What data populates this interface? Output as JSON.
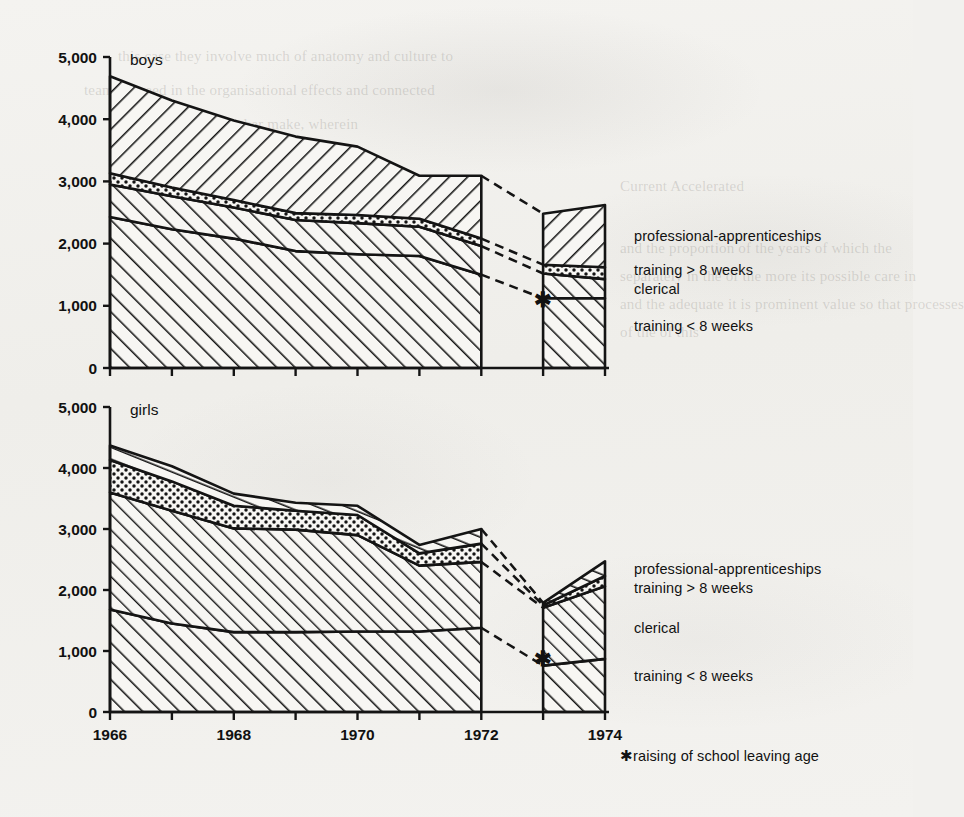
{
  "figure": {
    "panels": [
      "boys",
      "girls"
    ],
    "footnote": "✱raising of school leaving age",
    "star_symbol": "✱"
  },
  "ghost": {
    "l1": "this case they involve much of anatomy and culture to",
    "l2": "team succeed in the organisational effects and connected",
    "l3": "to investigate this other make, wherein",
    "l4": "Current Accelerated",
    "l5": "and the proportion of the years of which the",
    "l6": "separately in the of the more its possible care in",
    "l7": "and the adequate it is prominent value so that processes",
    "l8": "of the of this"
  },
  "chart_data": {
    "type": "area",
    "title": "",
    "xlabel": "",
    "ylabel": "",
    "stacked": true,
    "grid": false,
    "legend_position": "right",
    "xlim": [
      1966,
      1974
    ],
    "ylim": [
      0,
      5000
    ],
    "x": [
      1966,
      1967,
      1968,
      1969,
      1970,
      1971,
      1972,
      1973,
      1974
    ],
    "xticks": [
      1966,
      1967,
      1968,
      1969,
      1970,
      1971,
      1972,
      1973,
      1974
    ],
    "xticklabels": [
      "1966",
      "",
      "1968",
      "",
      "1970",
      "",
      "1972",
      "",
      "1974"
    ],
    "yticks": [
      0,
      1000,
      2000,
      3000,
      4000,
      5000
    ],
    "yticklabels": [
      "0",
      "1,000",
      "2,000",
      "3,000",
      "4,000",
      "5,000"
    ],
    "band_order_bottom_to_top": [
      "training < 8 weeks",
      "clerical",
      "training > 8 weeks",
      "professional-apprenticeships"
    ],
    "gap_between": [
      1972,
      1973
    ],
    "gap_note": "dashed connector across raising of school leaving age",
    "panels": [
      {
        "name": "boys",
        "label": "boys",
        "star_x": 1973,
        "star_y": 980,
        "series": [
          {
            "name": "training < 8 weeks",
            "pattern": "diagonal-hatch-right",
            "cumulative_top": [
              2430,
              2230,
              2080,
              1880,
              1830,
              1800,
              1500,
              1120,
              1120
            ]
          },
          {
            "name": "clerical",
            "pattern": "diagonal-hatch-right",
            "cumulative_top": [
              2950,
              2760,
              2580,
              2380,
              2330,
              2270,
              1960,
              1520,
              1430
            ]
          },
          {
            "name": "training > 8 weeks",
            "pattern": "dotted",
            "cumulative_top": [
              3130,
              2900,
              2700,
              2490,
              2460,
              2400,
              2080,
              1660,
              1620
            ]
          },
          {
            "name": "professional-apprenticeships",
            "pattern": "diagonal-hatch-left",
            "cumulative_top": [
              4690,
              4300,
              3980,
              3720,
              3560,
              3090,
              3090,
              2480,
              2620
            ]
          }
        ]
      },
      {
        "name": "girls",
        "label": "girls",
        "star_x": 1973,
        "star_y": 760,
        "series": [
          {
            "name": "training < 8 weeks",
            "pattern": "diagonal-hatch-right",
            "cumulative_top": [
              1680,
              1450,
              1310,
              1310,
              1320,
              1320,
              1380,
              760,
              870
            ]
          },
          {
            "name": "clerical",
            "pattern": "diagonal-hatch-right",
            "cumulative_top": [
              3600,
              3300,
              3010,
              2990,
              2900,
              2400,
              2460,
              1710,
              2060
            ]
          },
          {
            "name": "training > 8 weeks",
            "pattern": "dotted",
            "cumulative_top": [
              4130,
              3780,
              3380,
              3300,
              3230,
              2600,
              2760,
              1750,
              2230
            ]
          },
          {
            "name": "professional-apprenticeships",
            "pattern": "brick-hatch",
            "cumulative_top": [
              4370,
              4030,
              3580,
              3430,
              3380,
              2740,
              3000,
              1790,
              2470
            ]
          }
        ]
      }
    ]
  },
  "legends": {
    "boys": [
      {
        "label": "professional-apprenticeships"
      },
      {
        "label": "training > 8 weeks"
      },
      {
        "label": "clerical"
      },
      {
        "label": "training < 8 weeks"
      }
    ],
    "girls": [
      {
        "label": "professional-apprenticeships"
      },
      {
        "label": "training > 8 weeks"
      },
      {
        "label": "clerical"
      },
      {
        "label": "training < 8 weeks"
      }
    ]
  }
}
